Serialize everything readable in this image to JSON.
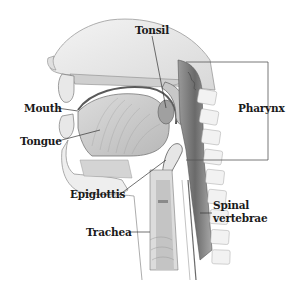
{
  "diagram": {
    "labels": {
      "tonsil": "Tonsil",
      "mouth": "Mouth",
      "tongue": "Tongue",
      "pharynx": "Pharynx",
      "epiglottis": "Epiglottis",
      "trachea": "Trachea",
      "spinal_line1": "Spinal",
      "spinal_line2": "vertebrae"
    },
    "colors": {
      "background": "#ffffff",
      "label_text": "#1a1a1a",
      "leader_line": "#333333",
      "tissue_light": "#e8e8e8",
      "tissue_mid": "#c4c4c4",
      "tissue_dark": "#8a8a8a",
      "cavity_dark": "#6e6e6e",
      "bracket": "#555555"
    }
  }
}
